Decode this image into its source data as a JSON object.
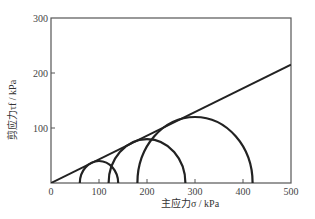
{
  "chart_data": {
    "type": "line",
    "title": "",
    "xlabel": "主应力σ / kPa",
    "ylabel": "剪应力τf / kPa",
    "xlim": [
      0,
      500
    ],
    "ylim": [
      0,
      300
    ],
    "x_ticks": [
      0,
      100,
      200,
      300,
      400,
      500
    ],
    "y_ticks": [
      100,
      200,
      300
    ],
    "grid": false,
    "legend": null,
    "series": [
      {
        "name": "强度包线 (failure envelope)",
        "kind": "line",
        "points": [
          [
            0,
            0
          ],
          [
            500,
            215
          ]
        ]
      },
      {
        "name": "莫尔圆 1",
        "kind": "semicircle",
        "center": 100,
        "radius": 40,
        "sigma3": 60,
        "sigma1": 140
      },
      {
        "name": "莫尔圆 2",
        "kind": "semicircle",
        "center": 200,
        "radius": 80,
        "sigma3": 120,
        "sigma1": 280
      },
      {
        "name": "莫尔圆 3",
        "kind": "semicircle",
        "center": 300,
        "radius": 120,
        "sigma3": 180,
        "sigma1": 420
      }
    ]
  },
  "axes": {
    "x": {
      "label": "主应力σ / kPa",
      "ticks": [
        "0",
        "100",
        "200",
        "300",
        "400",
        "500"
      ]
    },
    "y": {
      "label": "剪应力τf / kPa",
      "ticks": [
        "100",
        "200",
        "300"
      ]
    }
  },
  "colors": {
    "line": "#222222",
    "frame": "#555555"
  }
}
